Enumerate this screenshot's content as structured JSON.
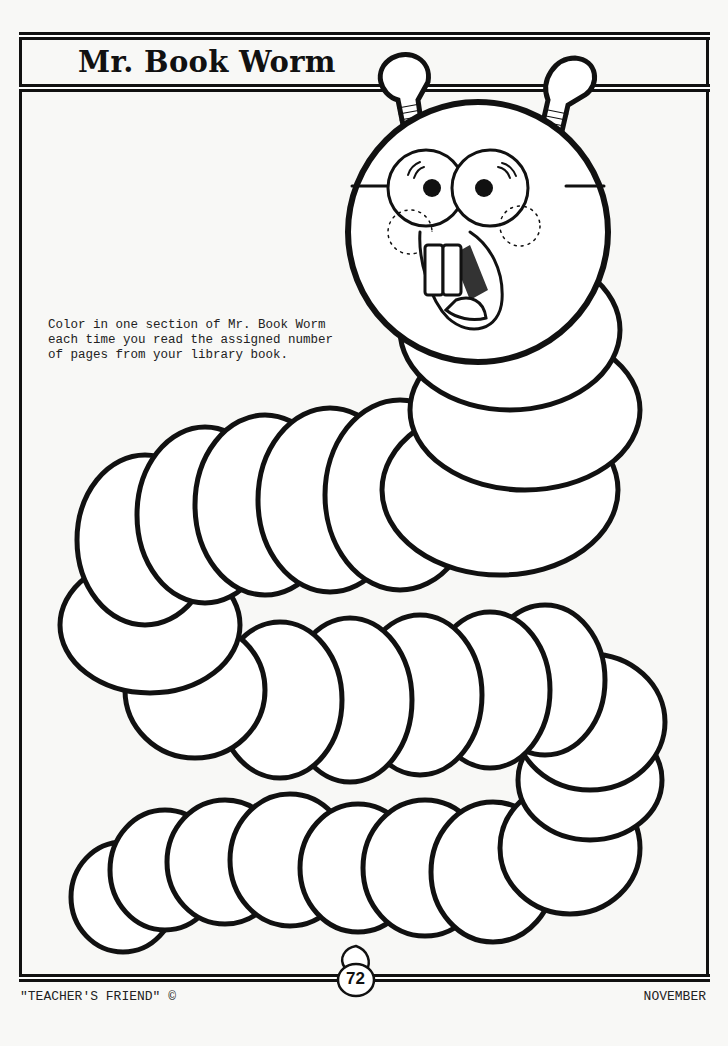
{
  "worksheet": {
    "title": "Mr. Book Worm",
    "instructions": "Color in one section of Mr. Book Worm each time you read the assigned number of pages from your library book.",
    "instruction_lines": [
      "Color in one section of Mr. Book Worm",
      "each time you read the assigned number",
      "of pages from your library book."
    ],
    "segment_count": 24
  },
  "footer": {
    "publisher": "\"TEACHER'S FRIEND\"",
    "copyright_symbol": "©",
    "page_number": "72",
    "month": "NOVEMBER"
  },
  "colors": {
    "ink": "#111111",
    "paper": "#f8f8f6"
  }
}
